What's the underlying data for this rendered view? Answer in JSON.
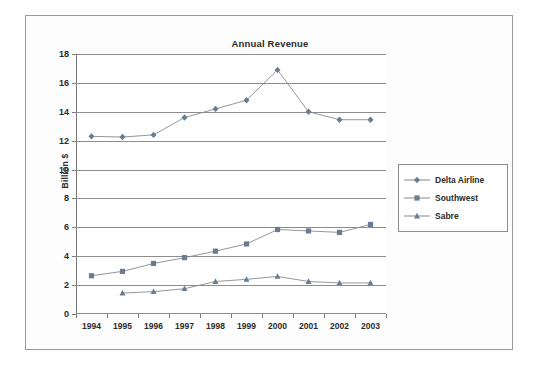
{
  "figure": {
    "title": "Annual Revenue"
  },
  "legend": {
    "position": "right",
    "entries": [
      {
        "label": "Delta Airline",
        "marker": "diamond-marker-icon",
        "color": "#6b7b93"
      },
      {
        "label": "Southwest",
        "marker": "square-marker-icon",
        "color": "#6b7b93"
      },
      {
        "label": "Sabre",
        "marker": "triangle-marker-icon",
        "color": "#6b7b93"
      }
    ]
  },
  "chart_data": {
    "type": "line",
    "title": "Annual Revenue",
    "xlabel": "",
    "ylabel": "Billion $",
    "categories": [
      "1994",
      "1995",
      "1996",
      "1997",
      "1998",
      "1999",
      "2000",
      "2001",
      "2002",
      "2003"
    ],
    "ylim": [
      0,
      18
    ],
    "ytick_step": 2,
    "yticks": [
      "18",
      "16",
      "14",
      "12",
      "10",
      "8",
      "6",
      "4",
      "2",
      "0"
    ],
    "grid": true,
    "grid_axis": "y",
    "series": [
      {
        "name": "Delta Airline",
        "marker": "diamond",
        "color": "#6b7b93",
        "line_color": "#8a8a8a",
        "values": [
          12.3,
          12.25,
          12.4,
          13.6,
          14.2,
          14.8,
          16.9,
          14.0,
          13.45,
          13.45
        ]
      },
      {
        "name": "Southwest",
        "marker": "square",
        "color": "#6b7b93",
        "line_color": "#8a8a8a",
        "values": [
          2.65,
          2.95,
          3.5,
          3.9,
          4.35,
          4.85,
          5.85,
          5.75,
          5.65,
          6.2
        ]
      },
      {
        "name": "Sabre",
        "marker": "triangle",
        "color": "#6b7b93",
        "line_color": "#8a8a8a",
        "values": [
          null,
          1.45,
          1.55,
          1.75,
          2.25,
          2.4,
          2.6,
          2.25,
          2.15,
          2.15
        ]
      }
    ]
  },
  "colors": {
    "frame": "#9a9a9a",
    "grid": "#8d8d8d",
    "axis": "#7a7a7a",
    "marker": "#6b7b93",
    "line": "#8a8a8a",
    "text": "#2b2b2b",
    "background": "#fefefe"
  }
}
